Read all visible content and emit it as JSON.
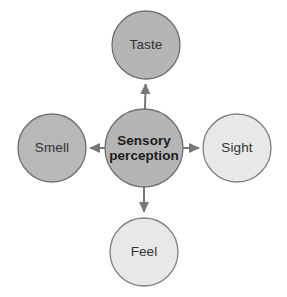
{
  "diagram": {
    "type": "radial-cross",
    "background_color": "#ffffff",
    "center": {
      "id": "sensory-perception",
      "label_line1": "Sensory",
      "label_line2": "perception",
      "label_full": "Sensory perception",
      "fill_color": "#b5b5b5",
      "stroke_color": "#6f6f6f",
      "text_color": "#1c1c1c",
      "bold": true,
      "cx": 144,
      "cy": 148,
      "r": 39
    },
    "nodes": [
      {
        "id": "taste",
        "label": "Taste",
        "position": "top",
        "fill_color": "#b5b5b5",
        "stroke_color": "#6f6f6f",
        "text_color": "#333333",
        "cx": 146,
        "cy": 45,
        "r": 34
      },
      {
        "id": "smell",
        "label": "Smell",
        "position": "left",
        "fill_color": "#b8b8b8",
        "stroke_color": "#6f6f6f",
        "text_color": "#333333",
        "cx": 52,
        "cy": 148,
        "r": 34
      },
      {
        "id": "sight",
        "label": "Sight",
        "position": "right",
        "fill_color": "#e8e8e8",
        "stroke_color": "#808080",
        "text_color": "#333333",
        "cx": 237,
        "cy": 148,
        "r": 34
      },
      {
        "id": "feel",
        "label": "Feel",
        "position": "bottom",
        "fill_color": "#e8e8e8",
        "stroke_color": "#808080",
        "text_color": "#333333",
        "cx": 144,
        "cy": 252,
        "r": 34
      }
    ],
    "arrows": [
      {
        "id": "arrow-to-taste",
        "from": "sensory-perception",
        "to": "taste",
        "direction": "up",
        "color": "#777777"
      },
      {
        "id": "arrow-to-smell",
        "from": "sensory-perception",
        "to": "smell",
        "direction": "left",
        "color": "#777777"
      },
      {
        "id": "arrow-to-sight",
        "from": "sensory-perception",
        "to": "sight",
        "direction": "right",
        "color": "#777777"
      },
      {
        "id": "arrow-to-feel",
        "from": "sensory-perception",
        "to": "feel",
        "direction": "down",
        "color": "#777777"
      }
    ]
  }
}
